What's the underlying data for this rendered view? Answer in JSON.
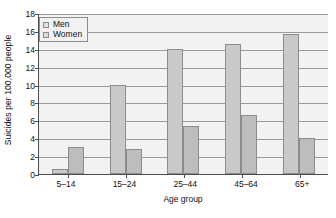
{
  "chart_data": {
    "type": "bar",
    "title": "",
    "xlabel": "Age group",
    "ylabel": "Suicides per 100,000 people",
    "categories": [
      "5–14",
      "15–24",
      "25–44",
      "45–64",
      "65+"
    ],
    "series": [
      {
        "name": "Men",
        "values": [
          0.6,
          10.0,
          14.0,
          14.5,
          15.7
        ],
        "color": "#c9c9c9"
      },
      {
        "name": "Women",
        "values": [
          3.0,
          2.8,
          5.4,
          6.6,
          4.0
        ],
        "color": "#bdbdbd"
      }
    ],
    "ylim": [
      0,
      18
    ],
    "yticks": [
      0,
      2,
      4,
      6,
      8,
      10,
      12,
      14,
      16,
      18
    ],
    "ytick_labels": [
      "0",
      "2",
      "4",
      "6",
      "8",
      "10",
      "12",
      "14",
      "16",
      "18"
    ],
    "grid": true,
    "grid_axis": "y",
    "legend_position": "top-left",
    "plot_background": "#f2f2f2",
    "gridline_color": "#9a9a9a",
    "axis_color": "#4d4d4d",
    "bar_border_color": "#8c8c8c"
  }
}
